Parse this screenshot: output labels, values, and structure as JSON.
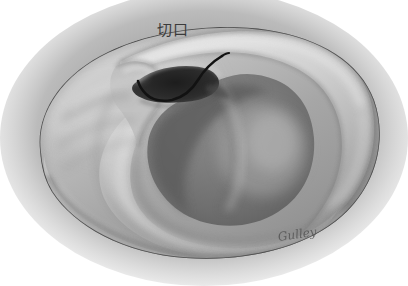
{
  "figure": {
    "medium": "grayscale pencil / airbrush anatomical drawing",
    "width": 408,
    "height": 286,
    "background_color": "#ffffff",
    "vignette_color": "#9c9c9c"
  },
  "annotations": {
    "incision_label": {
      "text": "切口",
      "meaning": "incision",
      "color": "#3b3b3b",
      "x": 157,
      "y": 22
    },
    "incision_line": {
      "name": "incision-marking-line",
      "color": "#121212",
      "description": "black curved line marking the planned surgical incision across the posterior concha, running from upper-right down and left over the ear canal opening"
    }
  },
  "signature": {
    "text": "Gulley",
    "color": "#4a4a4a",
    "x": 278,
    "y": 230
  },
  "palette": {
    "paper_white": "#ffffff",
    "vignette_gray": "#9a9a9a",
    "skin_midtone": "#a8a8a8",
    "skin_highlight": "#d6d6d6",
    "skin_bright": "#e8e8e8",
    "shadow_mid": "#6f6f6f",
    "shadow_deep": "#4a4a4a",
    "canal_black": "#262626",
    "outline": "#3a3a3a",
    "ink_black": "#121212"
  },
  "anatomy": {
    "parts": [
      {
        "name": "helix",
        "label": "helix rim",
        "tone": "#c4c4c4"
      },
      {
        "name": "antihelix",
        "label": "antihelix",
        "tone": "#b0b0b0"
      },
      {
        "name": "concha",
        "label": "conchal bowl",
        "tone": "#8e8e8e"
      },
      {
        "name": "external-auditory-canal",
        "label": "external auditory canal",
        "tone": "#262626"
      },
      {
        "name": "tragus",
        "label": "tragus",
        "tone": "#b8b8b8"
      },
      {
        "name": "lobule",
        "label": "lobule",
        "tone": "#bdbdbd"
      },
      {
        "name": "scaphoid-fossa",
        "label": "scaphoid fossa",
        "tone": "#9a9a9a"
      }
    ]
  }
}
